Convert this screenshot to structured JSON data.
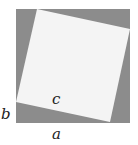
{
  "diagram": {
    "colors": {
      "outer": "#8c8c8c",
      "inner": "#f4f4f4",
      "label": "#222222"
    },
    "outer_square": {
      "x": 16,
      "y": 9,
      "size": 114
    },
    "inner_square_points": "37,9 130,29 110,122 16,102",
    "labels": {
      "c": "c",
      "b": "b",
      "a": "a"
    }
  }
}
